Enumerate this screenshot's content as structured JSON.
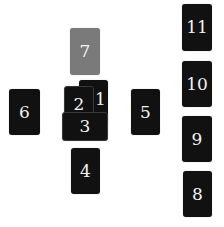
{
  "spread": {
    "cards": [
      {
        "position": 1,
        "label": "1"
      },
      {
        "position": 2,
        "label": "2"
      },
      {
        "position": 3,
        "label": "3"
      },
      {
        "position": 4,
        "label": "4"
      },
      {
        "position": 5,
        "label": "5"
      },
      {
        "position": 6,
        "label": "6"
      },
      {
        "position": 7,
        "label": "7"
      },
      {
        "position": 8,
        "label": "8"
      },
      {
        "position": 9,
        "label": "9"
      },
      {
        "position": 10,
        "label": "10"
      },
      {
        "position": 11,
        "label": "11"
      }
    ],
    "colors": {
      "card": "#111111",
      "highlighted_card": "#7a7a7a",
      "label": "#f2f2f2"
    }
  }
}
